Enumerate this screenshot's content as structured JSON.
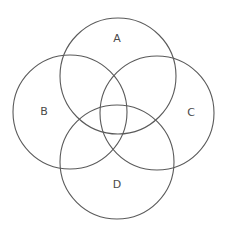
{
  "diagram": {
    "type": "venn",
    "sets": [
      {
        "id": "A",
        "label": "A"
      },
      {
        "id": "B",
        "label": "B"
      },
      {
        "id": "C",
        "label": "C"
      },
      {
        "id": "D",
        "label": "D"
      }
    ],
    "stroke_color": "#5a5a5a",
    "label_color": "#4a4a4a",
    "background": "#ffffff"
  }
}
